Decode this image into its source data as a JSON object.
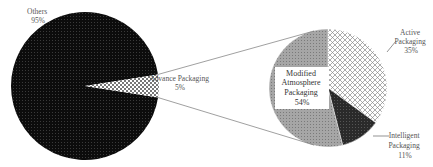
{
  "chart_data": [
    {
      "type": "pie",
      "title": "",
      "slices": [
        {
          "label": "Others",
          "value": 95,
          "value_label": "95%",
          "pattern": "dark-dots",
          "color": "#111111"
        },
        {
          "label": "Advance Packaging",
          "value": 5,
          "value_label": "5%",
          "pattern": "checker",
          "color": "#cccccc"
        }
      ]
    },
    {
      "type": "pie",
      "title": "Advance Packaging breakdown",
      "slices": [
        {
          "label": "Active Packaging",
          "value": 35,
          "value_label": "35%",
          "pattern": "diagonal-hatch",
          "color": "#ffffff"
        },
        {
          "label": "Intelligent Packaging",
          "value": 11,
          "value_label": "11%",
          "pattern": "dark-grid",
          "color": "#2e2e2e"
        },
        {
          "label": "Modified Atmosphere Packaging",
          "value": 54,
          "value_label": "54%",
          "pattern": "gray-dots",
          "color": "#9a9a9a"
        }
      ]
    }
  ],
  "labels": {
    "others": [
      "Others",
      "95%"
    ],
    "advance": [
      "Advance Packaging",
      "5%"
    ],
    "active": [
      "Active",
      "Packaging",
      "35%"
    ],
    "intelligent": [
      "Intelligent",
      "Packaging",
      "11%"
    ],
    "modified": [
      "Modified",
      "Atmosphere",
      "Packaging",
      "54%"
    ]
  }
}
